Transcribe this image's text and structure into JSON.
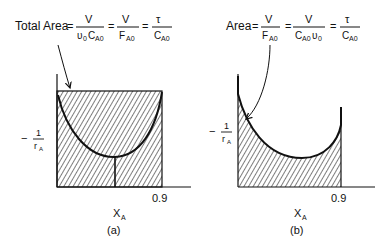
{
  "panel_a": {
    "caption": "(a)",
    "equation": {
      "lhs": "Total Area",
      "eq": "=",
      "f1_num": "V",
      "f1_den_a": "υ",
      "f1_den_a_sub": "0",
      "f1_den_b": "C",
      "f1_den_b_sub": "A0",
      "f2_num": "V",
      "f2_den": "F",
      "f2_den_sub": "A0",
      "f3_num": "τ",
      "f3_den": "C",
      "f3_den_sub": "A0"
    },
    "y_label_prefix": "−",
    "y_label_num": "1",
    "y_label_den": "r",
    "y_label_den_sub": "A",
    "x_label": "X",
    "x_label_sub": "A",
    "x_tick": "0.9"
  },
  "panel_b": {
    "caption": "(b)",
    "equation": {
      "lhs": "Area",
      "eq": "=",
      "f1_num": "V",
      "f1_den": "F",
      "f1_den_sub": "A0",
      "f2_num": "V",
      "f2_den_a": "C",
      "f2_den_a_sub": "A0",
      "f2_den_b": "υ",
      "f2_den_b_sub": "0",
      "f3_num": "τ",
      "f3_den": "C",
      "f3_den_sub": "A0"
    },
    "y_label_prefix": "−",
    "y_label_num": "1",
    "y_label_den": "r",
    "y_label_den_sub": "A",
    "x_label": "X",
    "x_label_sub": "A",
    "x_tick": "0.9"
  }
}
